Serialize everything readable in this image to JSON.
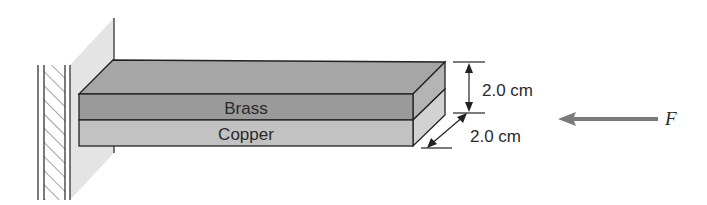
{
  "diagram": {
    "type": "cantilever-bimetallic-bar",
    "layers": [
      {
        "name": "top-layer",
        "label": "Brass",
        "color": "#9a9a9a"
      },
      {
        "name": "bottom-layer",
        "label": "Copper",
        "color": "#c2c2c2"
      }
    ],
    "top_face_color": "#a6a6a6",
    "side_face_top_color": "#b4b4b4",
    "side_face_bottom_color": "#d2d2d2",
    "wall_shadow_color": "#e4e4e4",
    "force_arrow_color": "#7a7a7a",
    "dimensions": {
      "height": "2.0 cm",
      "depth": "2.0 cm"
    },
    "force": {
      "label": "F",
      "direction": "left"
    }
  }
}
